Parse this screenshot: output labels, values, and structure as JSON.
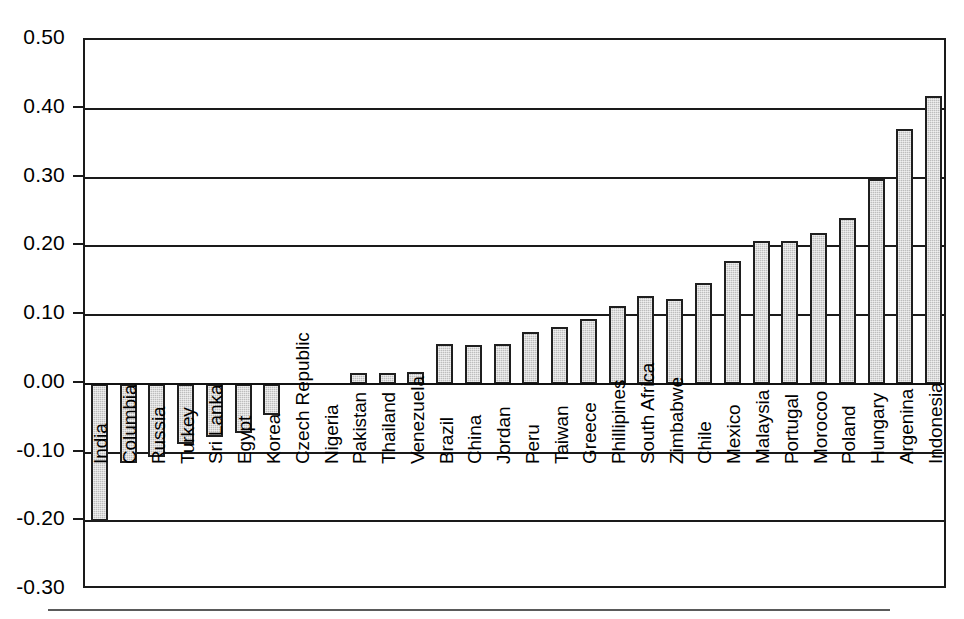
{
  "chart_data": {
    "type": "bar",
    "title": "",
    "subtitle": "",
    "xlabel": "",
    "ylabel": "",
    "ylim": [
      -0.3,
      0.5
    ],
    "ytick_labels": [
      "0.50",
      "0.40",
      "0.30",
      "0.20",
      "0.10",
      "0.00",
      "-0.10",
      "-0.20",
      "-0.30"
    ],
    "ytick_values": [
      0.5,
      0.4,
      0.3,
      0.2,
      0.1,
      0.0,
      -0.1,
      -0.2,
      -0.3
    ],
    "grid": true,
    "grid_axis": "y",
    "legend": "none",
    "orientation": "vertical",
    "bar_color": "#bdbdbd",
    "bar_edge_color": "#1f1f1f",
    "categories": [
      "India",
      "Columbia",
      "Russia",
      "Turkey",
      "Sri Lanka",
      "Egypt",
      "Korea",
      "Czech Republic",
      "Nigeria",
      "Pakistan",
      "Thailand",
      "Venezuela",
      "Brazil",
      "China",
      "Jordan",
      "Peru",
      "Taiwan",
      "Greece",
      "Phillipines",
      "South Africa",
      "Zimbabwe",
      "Chile",
      "Mexico",
      "Malaysia",
      "Portugal",
      "Morocoo",
      "Poland",
      "Hungary",
      "Argenina",
      "Indonesia"
    ],
    "values": [
      -0.2,
      -0.115,
      -0.106,
      -0.088,
      -0.077,
      -0.072,
      -0.045,
      0.0,
      0.0,
      0.016,
      0.016,
      0.017,
      0.058,
      0.057,
      0.058,
      0.075,
      0.083,
      0.094,
      0.113,
      0.127,
      0.124,
      0.147,
      0.178,
      0.208,
      0.208,
      0.219,
      0.241,
      0.298,
      0.37,
      0.418
    ]
  },
  "axis": {
    "y_min_label": "-0.30",
    "y_max_label": "0.50"
  }
}
